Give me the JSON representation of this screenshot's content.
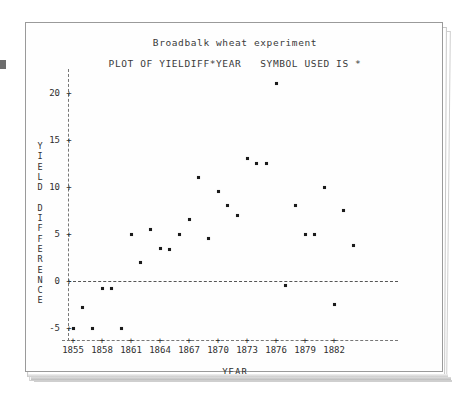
{
  "chart_data": {
    "type": "scatter",
    "title": "Broadbalk wheat experiment",
    "subtitle": "PLOT OF YIELDIFF*YEAR   SYMBOL USED IS *",
    "xlabel": "YEAR",
    "ylabel": "YIELD DIFFERENCE",
    "ylabel_stacked": "Y\nI\nE\nL\nD\n\nD\nI\nF\nF\nE\nR\nE\nN\nC\nE",
    "symbol": "*",
    "grid": false,
    "legend": "none",
    "xlim": [
      1853,
      1886
    ],
    "ylim": [
      -7,
      22
    ],
    "xticks": [
      1855,
      1858,
      1861,
      1864,
      1867,
      1870,
      1873,
      1876,
      1879,
      1882
    ],
    "yticks": [
      20,
      15,
      10,
      5,
      0,
      -5
    ],
    "zero_reference_line": 0,
    "x": [
      1855,
      1856,
      1857,
      1858,
      1859,
      1860,
      1861,
      1862,
      1863,
      1864,
      1865,
      1866,
      1867,
      1868,
      1869,
      1870,
      1871,
      1872,
      1873,
      1874,
      1875,
      1876,
      1877,
      1878,
      1879,
      1880,
      1881,
      1882,
      1883,
      1884
    ],
    "y": [
      -5.0,
      -2.8,
      -5.0,
      -0.8,
      -0.8,
      -5.0,
      5.0,
      2.0,
      5.5,
      3.5,
      3.3,
      5.0,
      6.5,
      11.0,
      4.5,
      9.5,
      8.0,
      7.0,
      13.0,
      12.5,
      12.5,
      21.0,
      -0.5,
      8.0,
      5.0,
      5.0,
      10.0,
      -2.5,
      7.5,
      3.8
    ],
    "points": [
      {
        "year": 1855,
        "yielddiff": -5.0
      },
      {
        "year": 1856,
        "yielddiff": -2.8
      },
      {
        "year": 1857,
        "yielddiff": -5.0
      },
      {
        "year": 1858,
        "yielddiff": -0.8
      },
      {
        "year": 1859,
        "yielddiff": -0.8
      },
      {
        "year": 1860,
        "yielddiff": -5.0
      },
      {
        "year": 1861,
        "yielddiff": 5.0
      },
      {
        "year": 1862,
        "yielddiff": 2.0
      },
      {
        "year": 1863,
        "yielddiff": 5.5
      },
      {
        "year": 1864,
        "yielddiff": 3.5
      },
      {
        "year": 1865,
        "yielddiff": 3.3
      },
      {
        "year": 1866,
        "yielddiff": 5.0
      },
      {
        "year": 1867,
        "yielddiff": 6.5
      },
      {
        "year": 1868,
        "yielddiff": 11.0
      },
      {
        "year": 1869,
        "yielddiff": 4.5
      },
      {
        "year": 1870,
        "yielddiff": 9.5
      },
      {
        "year": 1871,
        "yielddiff": 8.0
      },
      {
        "year": 1872,
        "yielddiff": 7.0
      },
      {
        "year": 1873,
        "yielddiff": 13.0
      },
      {
        "year": 1874,
        "yielddiff": 12.5
      },
      {
        "year": 1875,
        "yielddiff": 12.5
      },
      {
        "year": 1876,
        "yielddiff": 21.0
      },
      {
        "year": 1877,
        "yielddiff": -0.5
      },
      {
        "year": 1878,
        "yielddiff": 8.0
      },
      {
        "year": 1879,
        "yielddiff": 5.0
      },
      {
        "year": 1880,
        "yielddiff": 5.0
      },
      {
        "year": 1881,
        "yielddiff": 10.0
      },
      {
        "year": 1882,
        "yielddiff": -2.5
      },
      {
        "year": 1883,
        "yielddiff": 7.5
      },
      {
        "year": 1884,
        "yielddiff": 3.8
      }
    ]
  },
  "colors": {
    "point": "#1b1b1b",
    "axis": "#777777",
    "text": "#2f2f2f",
    "paper": "#ffffff",
    "paper_border": "#9a9a9a"
  }
}
